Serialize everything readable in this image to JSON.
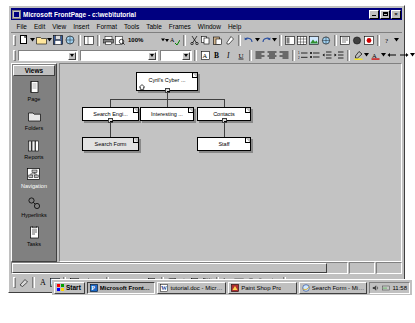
{
  "window": {
    "title": "Microsoft FrontPage - c:\\web\\tutorial",
    "icon": "frontpage-icon",
    "minimize_label": "_",
    "maximize_label": "□",
    "close_label": "×"
  },
  "menu": {
    "items": [
      {
        "label": "File"
      },
      {
        "label": "Edit"
      },
      {
        "label": "View"
      },
      {
        "label": "Insert"
      },
      {
        "label": "Format"
      },
      {
        "label": "Tools"
      },
      {
        "label": "Table"
      },
      {
        "label": "Frames"
      },
      {
        "label": "Window"
      },
      {
        "label": "Help"
      }
    ]
  },
  "toolbars": {
    "standard": {
      "zoom_value": "100%",
      "icons": [
        "new-page-icon",
        "open-folder-icon",
        "save-icon",
        "publish-icon",
        "folder-list-icon",
        "print-icon",
        "print-preview-icon",
        "spelling-icon",
        "cut-icon",
        "copy-icon",
        "paste-icon",
        "format-painter-icon",
        "undo-icon",
        "redo-icon",
        "insert-component-icon",
        "insert-table-icon",
        "insert-picture-icon",
        "hyperlink-icon",
        "refresh-icon",
        "stop-icon",
        "show-all-icon",
        "help-icon"
      ]
    },
    "formatting": {
      "style_value": "",
      "font_value": "",
      "size_value": "",
      "icons": [
        "change-font-icon",
        "bold-icon",
        "italic-icon",
        "underline-icon",
        "align-left-icon",
        "align-center-icon",
        "align-right-icon",
        "numbered-list-icon",
        "bulleted-list-icon",
        "decrease-indent-icon",
        "increase-indent-icon",
        "highlight-color-icon",
        "font-color-icon",
        "back-arrow-icon",
        "forward-arrow-icon"
      ]
    },
    "drawing": {
      "icons": [
        "draw-menu-icon",
        "insert-wordart-icon",
        "insert-picture-icon",
        "fill-color-icon",
        "line-color-icon",
        "font-color-icon",
        "line-style-icon",
        "dash-style-icon",
        "arrow-style-icon",
        "shadow-icon",
        "3d-icon",
        "rotate-icon",
        "order-icon",
        "group-icon",
        "select-objects-icon",
        "rectangle-icon",
        "oval-icon",
        "arc-icon",
        "polygon-icon",
        "autoshapes-icon"
      ]
    }
  },
  "views_bar": {
    "title": "Views",
    "items": [
      {
        "label": "Page",
        "icon": "page-view-icon",
        "selected": false
      },
      {
        "label": "Folders",
        "icon": "folders-view-icon",
        "selected": false
      },
      {
        "label": "Reports",
        "icon": "reports-view-icon",
        "selected": false
      },
      {
        "label": "Navigation",
        "icon": "navigation-view-icon",
        "selected": true
      },
      {
        "label": "Hyperlinks",
        "icon": "hyperlinks-view-icon",
        "selected": false
      },
      {
        "label": "Tasks",
        "icon": "tasks-view-icon",
        "selected": false
      }
    ]
  },
  "navigation_diagram": {
    "nodes": [
      {
        "id": "root",
        "label": "Cyril's Cyber ...",
        "home": true,
        "selected": false,
        "collapse": true
      },
      {
        "id": "search",
        "label": "Search Engi...",
        "home": false,
        "selected": false,
        "collapse": true
      },
      {
        "id": "interest",
        "label": "Interesting ...",
        "home": false,
        "selected": false,
        "collapse": false
      },
      {
        "id": "contacts",
        "label": "Contacts",
        "home": false,
        "selected": false,
        "collapse": true
      },
      {
        "id": "form",
        "label": "Search Form",
        "home": false,
        "selected": true,
        "collapse": false
      },
      {
        "id": "staff",
        "label": "Staff",
        "home": false,
        "selected": false,
        "collapse": false
      }
    ]
  },
  "taskbar": {
    "start_label": "Start",
    "clock": "11:58",
    "buttons": [
      {
        "label": "Microsoft FrontPage...",
        "icon": "frontpage-icon",
        "active": true
      },
      {
        "label": "tutorial.doc - Microsoft W...",
        "icon": "word-icon",
        "active": false
      },
      {
        "label": "Paint Shop Pro",
        "icon": "psp-icon",
        "active": false
      },
      {
        "label": "Search Form - Microsoft I...",
        "icon": "ie-icon",
        "active": false
      }
    ],
    "tray_icons": [
      "volume-icon",
      "modem-icon"
    ]
  },
  "colors": {
    "title_bar": "#000080",
    "face": "#c0c0c0",
    "views_bar": "#808080",
    "canvas": "#c3c3c3",
    "selection": "#e2e2e2"
  }
}
